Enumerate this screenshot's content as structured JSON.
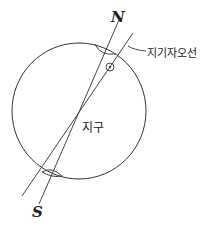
{
  "diagram": {
    "labels": {
      "north": "N",
      "south": "S",
      "geomagnetic_axis": "지기자오선",
      "earth": "지구"
    },
    "colors": {
      "stroke": "#333333",
      "text": "#222222",
      "background": "#ffffff"
    }
  }
}
